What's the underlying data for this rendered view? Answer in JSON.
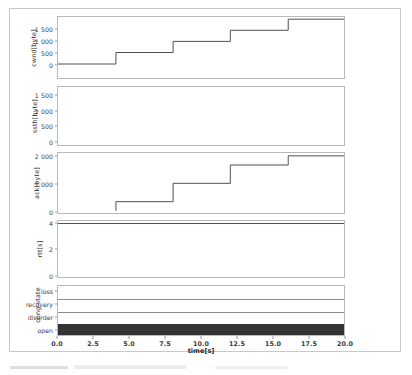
{
  "figure": {
    "xlabel": "time[s]",
    "xticks": [
      "0.0",
      "2.5",
      "5.0",
      "7.5",
      "10.0",
      "12.5",
      "15.0",
      "17.5",
      "20.0"
    ],
    "xtick_values": [
      0,
      2.5,
      5,
      7.5,
      10,
      12.5,
      15,
      17.5,
      20
    ],
    "xlim": [
      0,
      20
    ],
    "line_color": "#4d4d4d",
    "state_fill_color": "#333333",
    "frame_color": "#b9b9b9"
  },
  "panels": [
    {
      "ylabel": "cwnd[byte]",
      "yticks": [
        "0",
        "500",
        "1 000",
        "1 500"
      ],
      "ytick_values": [
        0,
        500,
        1000,
        1500
      ]
    },
    {
      "ylabel": "ssth[byte]",
      "yticks": [
        "0",
        "500",
        "1 000",
        "1 500"
      ],
      "ytick_values": [
        0,
        500,
        1000,
        1500
      ]
    },
    {
      "ylabel": "ack[byte]",
      "yticks": [
        "0",
        "1 000",
        "2 000"
      ],
      "ytick_values": [
        0,
        1000,
        2000
      ]
    },
    {
      "ylabel": "rtt[s]",
      "yticks": [
        "0",
        "2",
        "4"
      ],
      "ytick_values": [
        0,
        2,
        4
      ]
    },
    {
      "ylabel": "cong-state",
      "categories": [
        "open",
        "disorder",
        "recovery",
        "loss"
      ]
    }
  ],
  "chart_data": [
    {
      "type": "line",
      "title": "",
      "xlabel": "time[s]",
      "ylabel": "cwnd[byte]",
      "xlim": [
        0,
        20
      ],
      "ylim": [
        -60,
        1720
      ],
      "yticks": [
        0,
        500,
        1000,
        1500
      ],
      "ytick_labels": [
        "0",
        "500",
        "1 000",
        "1 500"
      ],
      "grid": false,
      "legend": "none",
      "drawstyle": "steps-post",
      "x": [
        0,
        4.05,
        4.05,
        8.05,
        8.05,
        12.05,
        12.05,
        16.1,
        16.1,
        20
      ],
      "y": [
        348,
        348,
        684,
        684,
        1008,
        1008,
        1332,
        1332,
        1656,
        1656
      ]
    },
    {
      "type": "line",
      "title": "",
      "xlabel": "time[s]",
      "ylabel": "ssth[byte]",
      "xlim": [
        0,
        20
      ],
      "ylim": [
        -60,
        1720
      ],
      "yticks": [
        0,
        500,
        1000,
        1500
      ],
      "ytick_labels": [
        "0",
        "500",
        "1 000",
        "1 500"
      ],
      "grid": false,
      "legend": "none",
      "note": "no data plotted - empty axes",
      "x": [],
      "y": []
    },
    {
      "type": "line",
      "title": "",
      "xlabel": "time[s]",
      "ylabel": "ack[byte]",
      "xlim": [
        0,
        20
      ],
      "ylim": [
        -80,
        2120
      ],
      "yticks": [
        0,
        1000,
        2000
      ],
      "ytick_labels": [
        "0",
        "1 000",
        "2 000"
      ],
      "grid": false,
      "legend": "none",
      "drawstyle": "steps-post",
      "x": [
        4.05,
        4.05,
        8.05,
        8.05,
        12.05,
        12.05,
        16.1,
        16.1,
        20
      ],
      "y": [
        0,
        336,
        336,
        1008,
        1008,
        1680,
        1680,
        2016,
        2016
      ]
    },
    {
      "type": "line",
      "title": "",
      "xlabel": "time[s]",
      "ylabel": "rtt[s]",
      "xlim": [
        0,
        20
      ],
      "ylim": [
        -0.18,
        4.25
      ],
      "yticks": [
        0,
        2,
        4
      ],
      "ytick_labels": [
        "0",
        "2",
        "4"
      ],
      "grid": false,
      "legend": "none",
      "drawstyle": "steps-post",
      "x": [
        0,
        20
      ],
      "y": [
        4.05,
        4.05
      ]
    },
    {
      "type": "area",
      "title": "",
      "xlabel": "time[s]",
      "ylabel": "cong-state",
      "xlim": [
        0,
        20
      ],
      "categories": [
        "open",
        "disorder",
        "recovery",
        "loss"
      ],
      "grid": false,
      "legend": "none",
      "note": "filled band at state 'open' across full time range; separator lines at disorder and recovery",
      "state_spans": [
        {
          "state": "open",
          "start": 0,
          "end": 20
        }
      ]
    }
  ]
}
